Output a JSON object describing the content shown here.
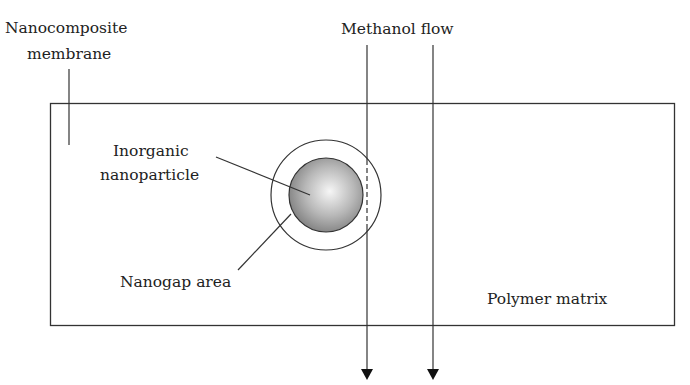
{
  "diagram": {
    "labels": {
      "membrane_line1": "Nanocomposite",
      "membrane_line2": "membrane",
      "flow": "Methanol flow",
      "particle_line1": "Inorganic",
      "particle_line2": "nanoparticle",
      "nanogap": "Nanogap area",
      "matrix": "Polymer matrix"
    },
    "colors": {
      "stroke": "#333333",
      "particle_center": "#f4f4f4",
      "particle_edge": "#7a7a7a"
    }
  }
}
